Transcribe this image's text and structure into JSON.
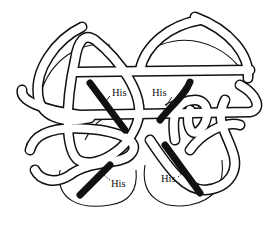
{
  "figure": {
    "type": "protein tube/ribbon structure diagram",
    "background": "#ffffff",
    "line_color": "#111111",
    "labels": [
      {
        "id": "his-top-left",
        "text": "His",
        "x": 112,
        "y": 96
      },
      {
        "id": "his-top-right",
        "text": "His",
        "x": 152,
        "y": 96
      },
      {
        "id": "his-bottom-left",
        "text": "His",
        "x": 111,
        "y": 187
      },
      {
        "id": "his-bottom-right",
        "text": "His",
        "x": 161,
        "y": 182
      }
    ]
  }
}
